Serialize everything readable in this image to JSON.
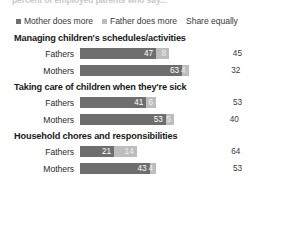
{
  "cut_headline": "percent of employed parents who say...",
  "legend": {
    "items": [
      {
        "label": "Mother does more",
        "color": "#6e6e6e",
        "key": "mother"
      },
      {
        "label": "Father does more",
        "color": "#bdbdbd",
        "key": "father"
      },
      {
        "label": "Share equally",
        "color": "#ffffff",
        "key": "equal"
      }
    ]
  },
  "chart_data": {
    "type": "bar",
    "subtype": "stacked-horizontal",
    "title": "",
    "xlabel": "",
    "ylabel": "",
    "xlim": [
      0,
      100
    ],
    "grid": false,
    "legend_position": "top",
    "series": [
      {
        "name": "Mother does more",
        "color": "#6e6e6e"
      },
      {
        "name": "Father does more",
        "color": "#bdbdbd"
      },
      {
        "name": "Share equally",
        "color": "#ffffff"
      }
    ],
    "groups": [
      {
        "title": "Managing children's schedules/activities",
        "rows": [
          {
            "label": "Fathers",
            "mother": 47,
            "father": 8,
            "equal": 45
          },
          {
            "label": "Mothers",
            "mother": 63,
            "father": 4,
            "equal": 32
          }
        ]
      },
      {
        "title": "Taking care of children when they're sick",
        "rows": [
          {
            "label": "Fathers",
            "mother": 41,
            "father": 6,
            "equal": 53
          },
          {
            "label": "Mothers",
            "mother": 53,
            "father": 5,
            "equal": 40
          }
        ]
      },
      {
        "title": "Household chores and responsibilities",
        "rows": [
          {
            "label": "Fathers",
            "mother": 21,
            "father": 14,
            "equal": 64
          },
          {
            "label": "Mothers",
            "mother": 43,
            "father": 4,
            "equal": 53
          }
        ]
      }
    ]
  }
}
